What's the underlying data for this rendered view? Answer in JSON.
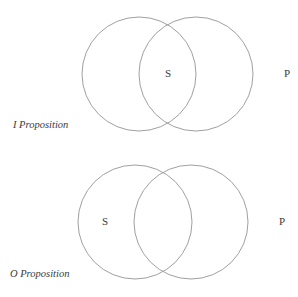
{
  "diagrams": [
    {
      "caption": "I Proposition",
      "subject_label": "S",
      "predicate_label": "P",
      "stroke_color": "#a0a0a0",
      "text_color": "#3a3a3a"
    },
    {
      "caption": "O Proposition",
      "subject_label": "S",
      "predicate_label": "P",
      "stroke_color": "#a0a0a0",
      "text_color": "#3a3a3a"
    }
  ]
}
